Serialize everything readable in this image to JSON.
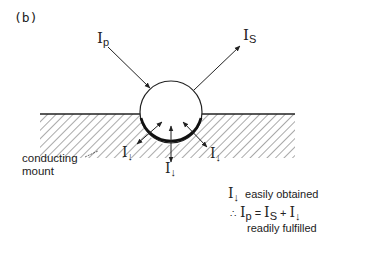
{
  "figure": {
    "panel_label": "(b)",
    "beams": {
      "primary": {
        "symbol": "I",
        "subscript": "p"
      },
      "secondary": {
        "symbol": "I",
        "subscript": "S"
      },
      "ground": {
        "symbol": "I",
        "subscript": "↓"
      }
    },
    "mount_label_line1": "conducting",
    "mount_label_line2": "mount",
    "notes": {
      "line1_symbol": "I",
      "line1_sub": "↓",
      "line1_text": "easily obtained",
      "therefore": "∴",
      "eq_ip": "I",
      "eq_ip_sub": "p",
      "eq_equals": "=",
      "eq_is": "I",
      "eq_is_sub": "S",
      "eq_plus": "+",
      "eq_ig": "I",
      "eq_ig_sub": "↓",
      "line3_text": "readily fulfilled"
    },
    "colors": {
      "ink": "#222222",
      "hatch": "#555555",
      "background": "#ffffff"
    }
  }
}
